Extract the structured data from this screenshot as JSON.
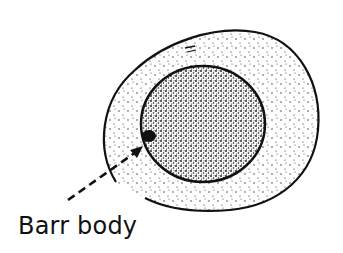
{
  "diagram": {
    "labels": [
      {
        "id": "barr-body",
        "text": "Barr body"
      }
    ],
    "parts": [
      "cell-membrane",
      "cytoplasm",
      "nucleus",
      "barr-body",
      "pointer-arrow"
    ],
    "colors": {
      "ink": "#111111",
      "background": "#ffffff"
    }
  }
}
